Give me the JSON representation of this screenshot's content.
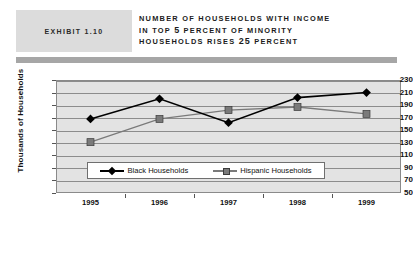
{
  "header": {
    "exhibit_label": "EXHIBIT 1.10",
    "title_lines": [
      "NUMBER OF HOUSEHOLDS WITH INCOME",
      "IN TOP 5 PERCENT OF MINORITY",
      "HOUSEHOLDS RISES 25 PERCENT"
    ],
    "title_full": "NUMBER OF HOUSEHOLDS WITH INCOME IN TOP 5 PERCENT OF MINORITY HOUSEHOLDS RISES 25 PERCENT"
  },
  "colors": {
    "badge_background": "#dcdcdc",
    "header_rule": "#a6a6a6",
    "plot_background": "#e3e3e3",
    "gridline": "#8c8c8c",
    "black_households": "#000000",
    "hispanic_households": "#7a7a7a",
    "page_background": "#ffffff"
  },
  "chart_data": {
    "type": "line",
    "title": "NUMBER OF HOUSEHOLDS WITH INCOME IN TOP 5 PERCENT OF MINORITY HOUSEHOLDS RISES 25 PERCENT",
    "xlabel": "",
    "ylabel": "Thousands of Households",
    "categories": [
      "1995",
      "1996",
      "1997",
      "1998",
      "1999"
    ],
    "ylim": [
      50,
      230
    ],
    "ytick_step": 20,
    "yticks": [
      230,
      210,
      190,
      170,
      150,
      130,
      110,
      90,
      70,
      50
    ],
    "grid": true,
    "legend_position": "bottom",
    "series": [
      {
        "name": "Black Households",
        "marker": "diamond",
        "color": "#000000",
        "values": [
          168,
          200,
          162,
          202,
          210
        ]
      },
      {
        "name": "Hispanic Households",
        "marker": "square",
        "color": "#7a7a7a",
        "values": [
          131,
          168,
          182,
          187,
          176
        ]
      }
    ]
  }
}
